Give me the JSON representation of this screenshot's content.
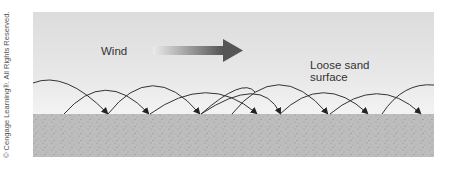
{
  "figure": {
    "labels": {
      "wind": "Wind",
      "surface_line1": "Loose sand",
      "surface_line2": "surface"
    },
    "credit": "© Cengage Learning®. All Rights Reserved.",
    "colors": {
      "sky": "#e8e8e8",
      "sand": "#bdbdbd",
      "arrow": "#555555",
      "trajectory": "#333333"
    },
    "elements": {
      "wind_arrow": "gradient-right-arrow-icon",
      "trajectories": "saltation-arc-arrows"
    }
  }
}
